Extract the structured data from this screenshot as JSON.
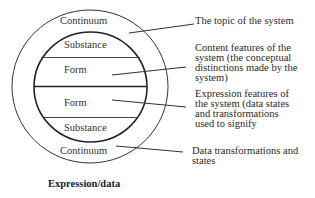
{
  "diagram": {
    "caption": "Expression/data",
    "circle_labels": {
      "outer_top": "Continuum",
      "inner_top": "Substance",
      "form_top": "Form",
      "form_bottom": "Form",
      "inner_bottom": "Substance",
      "outer_bottom": "Continuum"
    },
    "annotations": [
      {
        "id": "topic",
        "lines": [
          "The topic of the system"
        ]
      },
      {
        "id": "content",
        "lines": [
          "Content features of the",
          "system (the  conceptual",
          "distinctions made by the",
          "system)"
        ]
      },
      {
        "id": "expression",
        "lines": [
          "Expression features of",
          "the system (data states",
          "and transformations",
          "used to signify"
        ]
      },
      {
        "id": "data",
        "lines": [
          "Data transformations and",
          "states"
        ]
      }
    ]
  }
}
